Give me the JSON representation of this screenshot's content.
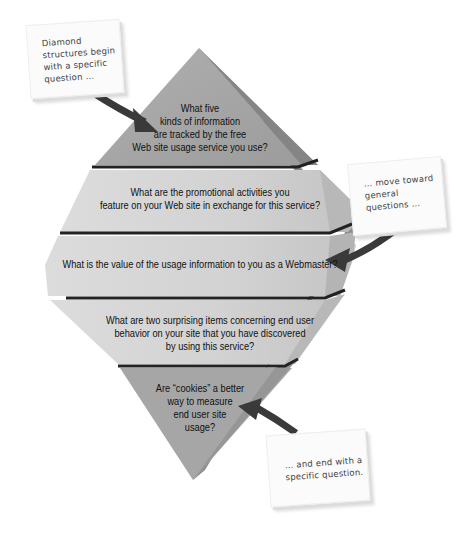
{
  "diagram": {
    "type": "diamond-question-structure",
    "bands": [
      {
        "id": "band-1",
        "lines": [
          "What five",
          "kinds of information",
          "are tracked by the free",
          "Web site usage service you use?"
        ]
      },
      {
        "id": "band-2",
        "lines": [
          "What are the promotional activities you",
          "feature on your Web site in exchange for this service?"
        ]
      },
      {
        "id": "band-3",
        "lines": [
          "What is the value of the usage information to you as a Webmaster?"
        ]
      },
      {
        "id": "band-4",
        "lines": [
          "What are two surprising items concerning end user",
          "behavior on your site that you have discovered",
          "by using this service?"
        ]
      },
      {
        "id": "band-5",
        "lines": [
          "Are “cookies” a better",
          "way to measure",
          "end user site",
          "usage?"
        ]
      }
    ],
    "notes": [
      {
        "id": "note-top",
        "lines": [
          "Diamond",
          "structures begin",
          "with a specific",
          "question …"
        ]
      },
      {
        "id": "note-middle",
        "lines": [
          "… move toward",
          "general",
          "questions …"
        ]
      },
      {
        "id": "note-bottom",
        "lines": [
          "… and end with a",
          "specific question."
        ]
      }
    ],
    "colors": {
      "top_band": "#a3a3a3",
      "middle_bands": "#d6d6d6",
      "bottom_band": "#a8a8a8",
      "right_face": "#8a8a8a",
      "divider": "#222222",
      "arrow": "#3a3a3a",
      "note_bg": "#fbfbfb"
    }
  }
}
